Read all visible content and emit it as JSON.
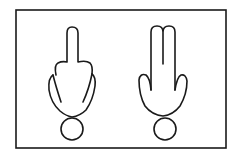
{
  "diagram": {
    "figures": [
      {
        "id": "one-finger",
        "label": "",
        "fingers_raised": 1
      },
      {
        "id": "two-fingers",
        "label": "",
        "fingers_raised": 2
      }
    ],
    "colors": {
      "stroke": "#1a1a1a",
      "background": "#ffffff"
    }
  }
}
